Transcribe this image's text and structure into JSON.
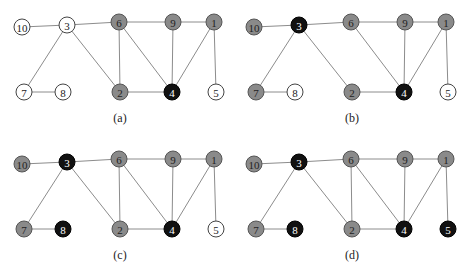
{
  "colors": {
    "white": "#ffffff",
    "gray": "#8a8a8a",
    "black": "#111111",
    "edge": "#8c8c8c"
  },
  "nodes_layout": {
    "10": [
      22,
      27
    ],
    "3": [
      67,
      25
    ],
    "6": [
      119,
      22
    ],
    "9": [
      173,
      22
    ],
    "1": [
      214,
      22
    ],
    "7": [
      24,
      92
    ],
    "8": [
      63,
      92
    ],
    "2": [
      120,
      92
    ],
    "4": [
      172,
      92
    ],
    "5": [
      216,
      92
    ]
  },
  "panels": [
    {
      "caption": "(a)",
      "offset": [
        0,
        0
      ],
      "edges": [
        [
          "10",
          "3"
        ],
        [
          "3",
          "6"
        ],
        [
          "6",
          "9"
        ],
        [
          "9",
          "1"
        ],
        [
          "3",
          "7"
        ],
        [
          "7",
          "8"
        ],
        [
          "3",
          "2"
        ],
        [
          "6",
          "2"
        ],
        [
          "6",
          "4"
        ],
        [
          "9",
          "4"
        ],
        [
          "1",
          "4"
        ],
        [
          "1",
          "5"
        ],
        [
          "2",
          "4"
        ]
      ],
      "node_states": {
        "10": "white",
        "3": "white",
        "6": "gray",
        "9": "gray",
        "1": "gray",
        "7": "white",
        "8": "white",
        "2": "gray",
        "4": "black",
        "5": "white"
      }
    },
    {
      "caption": "(b)",
      "offset": [
        232,
        0
      ],
      "edges": [
        [
          "10",
          "3"
        ],
        [
          "3",
          "6"
        ],
        [
          "6",
          "9"
        ],
        [
          "9",
          "1"
        ],
        [
          "3",
          "7"
        ],
        [
          "7",
          "8"
        ],
        [
          "3",
          "2"
        ],
        [
          "6",
          "4"
        ],
        [
          "9",
          "4"
        ],
        [
          "1",
          "4"
        ],
        [
          "1",
          "5"
        ],
        [
          "2",
          "4"
        ]
      ],
      "node_states": {
        "10": "gray",
        "3": "black",
        "6": "gray",
        "9": "gray",
        "1": "gray",
        "7": "gray",
        "8": "white",
        "2": "gray",
        "4": "black",
        "5": "white"
      }
    },
    {
      "caption": "(c)",
      "offset": [
        0,
        137
      ],
      "edges": [
        [
          "10",
          "3"
        ],
        [
          "3",
          "6"
        ],
        [
          "6",
          "9"
        ],
        [
          "9",
          "1"
        ],
        [
          "3",
          "7"
        ],
        [
          "7",
          "8"
        ],
        [
          "3",
          "2"
        ],
        [
          "6",
          "2"
        ],
        [
          "6",
          "4"
        ],
        [
          "9",
          "4"
        ],
        [
          "1",
          "4"
        ],
        [
          "1",
          "5"
        ],
        [
          "2",
          "4"
        ]
      ],
      "node_states": {
        "10": "gray",
        "3": "black",
        "6": "gray",
        "9": "gray",
        "1": "gray",
        "7": "gray",
        "8": "black",
        "2": "gray",
        "4": "black",
        "5": "white"
      }
    },
    {
      "caption": "(d)",
      "offset": [
        232,
        137
      ],
      "edges": [
        [
          "10",
          "3"
        ],
        [
          "3",
          "6"
        ],
        [
          "6",
          "9"
        ],
        [
          "9",
          "1"
        ],
        [
          "3",
          "7"
        ],
        [
          "7",
          "8"
        ],
        [
          "3",
          "2"
        ],
        [
          "6",
          "2"
        ],
        [
          "6",
          "4"
        ],
        [
          "9",
          "4"
        ],
        [
          "1",
          "4"
        ],
        [
          "1",
          "5"
        ],
        [
          "2",
          "4"
        ]
      ],
      "node_states": {
        "10": "gray",
        "3": "black",
        "6": "gray",
        "9": "gray",
        "1": "gray",
        "7": "gray",
        "8": "black",
        "2": "gray",
        "4": "black",
        "5": "black"
      }
    }
  ]
}
